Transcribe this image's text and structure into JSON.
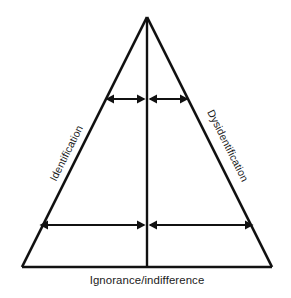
{
  "figure": {
    "kind": "triangle-diagram",
    "background_color": "#ffffff",
    "line_color": "#111111",
    "text_color": "#1a1a1a",
    "width": 291,
    "height": 298
  },
  "labels": {
    "left_edge": "Identification",
    "right_edge": "Dysidentification",
    "base": "Ignorance/indifference"
  },
  "geometry": {
    "apex": {
      "x": 147,
      "y": 17
    },
    "bottom_left": {
      "x": 22,
      "y": 267
    },
    "bottom_right": {
      "x": 272,
      "y": 267
    },
    "center_axis_x": 147,
    "upper_arrow_row": {
      "y": 99,
      "x_start": 106,
      "x_end": 188
    },
    "lower_arrow_row": {
      "y": 225,
      "x_start": 40,
      "x_end": 253
    },
    "left_label_rotation_deg": -63.4,
    "right_label_rotation_deg": 63.4
  }
}
